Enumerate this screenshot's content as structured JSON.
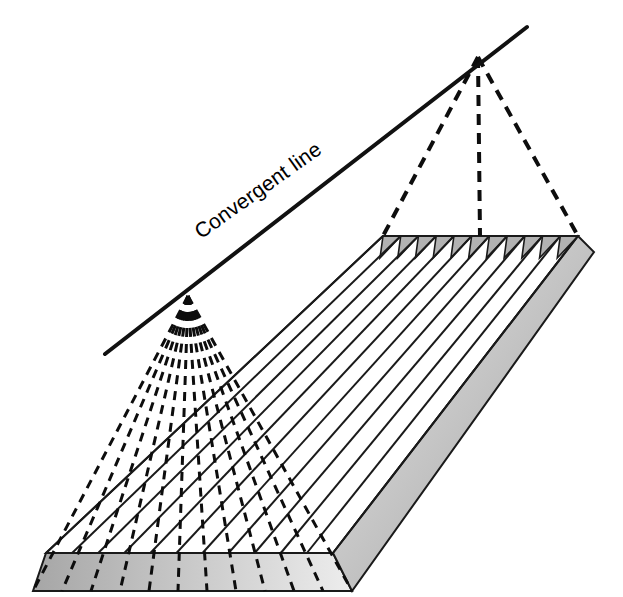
{
  "figure": {
    "width": 623,
    "height": 597,
    "background_color": "#ffffff",
    "stroke_color": "#1a1a1a"
  },
  "labels": {
    "convergent_line": "Convergent line",
    "convergent_line_font_size": 21,
    "convergent_line_anchor": {
      "x": 262,
      "y": 196
    },
    "convergent_line_rotation_deg": -35.5
  },
  "convergent_line": {
    "name": "convergent-line",
    "start": {
      "x": 105,
      "y": 354
    },
    "end": {
      "x": 527,
      "y": 27
    },
    "stroke_width": 4,
    "color": "#111111"
  },
  "vanishing_points": {
    "left": {
      "x": 188,
      "y": 296,
      "name": "left-vanishing-point"
    },
    "right": {
      "x": 478,
      "y": 57,
      "name": "right-vanishing-point"
    }
  },
  "slab": {
    "name": "ground-slab",
    "top_face": {
      "corners": {
        "front_left": {
          "x": 46,
          "y": 553
        },
        "front_right": {
          "x": 333,
          "y": 553
        },
        "back_right": {
          "x": 578,
          "y": 236
        },
        "back_left": {
          "x": 383,
          "y": 236
        }
      },
      "fill": "#ffffff"
    },
    "front_face": {
      "name": "slab-front-face",
      "points": [
        {
          "x": 46,
          "y": 553
        },
        {
          "x": 333,
          "y": 553
        },
        {
          "x": 352,
          "y": 591
        },
        {
          "x": 33,
          "y": 591
        }
      ],
      "gradient_from": "#a6a6a6",
      "gradient_to": "#ededed"
    },
    "right_face": {
      "name": "slab-right-face",
      "points": [
        {
          "x": 333,
          "y": 553
        },
        {
          "x": 578,
          "y": 236
        },
        {
          "x": 594,
          "y": 252
        },
        {
          "x": 352,
          "y": 591
        }
      ],
      "gradient_from": "#e9e9e9",
      "gradient_to": "#9e9e9e"
    },
    "thickness_px": 38
  },
  "sawtooth": {
    "name": "sawtooth-band",
    "description": "Triangular notches along the far (back) edge of the slab top face",
    "count": 11,
    "band_height": 22,
    "fill": "#b2b2b2",
    "left_x": 383,
    "right_x": 578,
    "y": 236,
    "tooth_skew": 20
  },
  "solid_rays": {
    "name": "parallel-solid-rays",
    "description": "Solid lines running from the back sawtooth edge to the front edge of the slab",
    "count": 11,
    "stroke_width": 2,
    "color": "#1a1a1a",
    "back_x_start": 383,
    "back_x_end": 578,
    "back_y": 236,
    "front_x_start": 46,
    "front_x_end": 333,
    "front_y": 553
  },
  "dashed_rays_left": {
    "name": "left-convergent-dashed-rays",
    "description": "Dashed lines radiating from the left vanishing point down across the slab",
    "count": 11,
    "stroke_width": 3,
    "dash_pattern": "9,7",
    "color": "#0d0d0d",
    "origin": {
      "x": 188,
      "y": 296
    },
    "targets_top_y": 553,
    "targets_bottom_y": 591,
    "top_x_start": 46,
    "top_x_end": 333,
    "bottom_x_start": 33,
    "bottom_x_end": 352
  },
  "dashed_rays_right": {
    "name": "right-convergent-dashed-rays",
    "description": "Dashed lines from the right vanishing point to the back edge of the slab",
    "count": 3,
    "stroke_width": 4,
    "dash_pattern": "11,8",
    "color": "#0d0d0d",
    "origin": {
      "x": 478,
      "y": 57
    },
    "targets": [
      {
        "x": 383,
        "y": 236
      },
      {
        "x": 480,
        "y": 236
      },
      {
        "x": 578,
        "y": 236
      }
    ]
  },
  "colors": {
    "ink": "#1a1a1a",
    "sawtooth_gray": "#b2b2b2",
    "front_face_light": "#ededed",
    "front_face_dark": "#a6a6a6",
    "right_face_light": "#e9e9e9",
    "right_face_dark": "#9e9e9e",
    "background": "#ffffff"
  }
}
